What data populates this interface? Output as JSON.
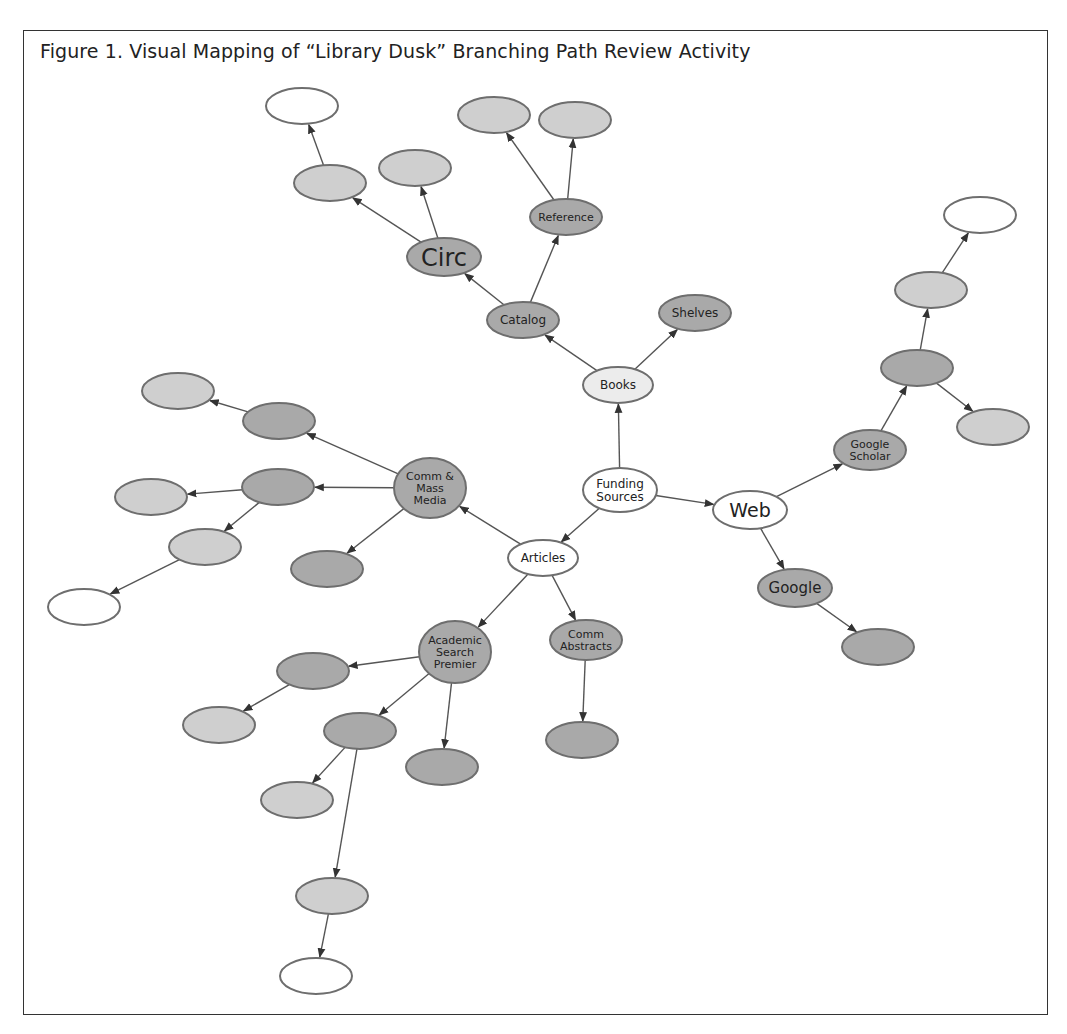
{
  "figure": {
    "title": "Figure 1. Visual Mapping of “Library Dusk” Branching Path Review Activity"
  },
  "colors": {
    "white": "#ffffff",
    "light": "#ececec",
    "medium": "#cfcfcf",
    "dark": "#a9a9a9",
    "stroke": "#6e6e6e",
    "edge": "#555555"
  },
  "nodes": [
    {
      "id": "funding",
      "label": [
        "Funding",
        "Sources"
      ],
      "x": 620,
      "y": 490,
      "rx": 37,
      "ry": 22,
      "fill": "white",
      "fs": 12
    },
    {
      "id": "books",
      "label": [
        "Books"
      ],
      "x": 618,
      "y": 385,
      "rx": 35,
      "ry": 18,
      "fill": "light",
      "fs": 12
    },
    {
      "id": "catalog",
      "label": [
        "Catalog"
      ],
      "x": 523,
      "y": 320,
      "rx": 36,
      "ry": 18,
      "fill": "dark",
      "fs": 12
    },
    {
      "id": "shelves",
      "label": [
        "Shelves"
      ],
      "x": 695,
      "y": 313,
      "rx": 36,
      "ry": 18,
      "fill": "dark",
      "fs": 12
    },
    {
      "id": "circ",
      "label": [
        "Circ"
      ],
      "x": 444,
      "y": 257,
      "rx": 37,
      "ry": 19,
      "fill": "dark",
      "fs": 24
    },
    {
      "id": "reference",
      "label": [
        "Reference"
      ],
      "x": 566,
      "y": 217,
      "rx": 36,
      "ry": 18,
      "fill": "dark",
      "fs": 11
    },
    {
      "id": "circ_a",
      "label": [],
      "x": 330,
      "y": 183,
      "rx": 36,
      "ry": 18,
      "fill": "medium"
    },
    {
      "id": "circ_a1",
      "label": [],
      "x": 302,
      "y": 106,
      "rx": 36,
      "ry": 18,
      "fill": "white"
    },
    {
      "id": "circ_b",
      "label": [],
      "x": 415,
      "y": 168,
      "rx": 36,
      "ry": 18,
      "fill": "medium"
    },
    {
      "id": "ref_a",
      "label": [],
      "x": 494,
      "y": 115,
      "rx": 36,
      "ry": 18,
      "fill": "medium"
    },
    {
      "id": "ref_b",
      "label": [],
      "x": 575,
      "y": 120,
      "rx": 36,
      "ry": 18,
      "fill": "medium"
    },
    {
      "id": "web",
      "label": [
        "Web"
      ],
      "x": 750,
      "y": 510,
      "rx": 37,
      "ry": 19,
      "fill": "white",
      "fs": 19
    },
    {
      "id": "gscholar",
      "label": [
        "Google",
        "Scholar"
      ],
      "x": 870,
      "y": 450,
      "rx": 36,
      "ry": 20,
      "fill": "dark",
      "fs": 11
    },
    {
      "id": "gs_a",
      "label": [],
      "x": 917,
      "y": 368,
      "rx": 36,
      "ry": 18,
      "fill": "dark"
    },
    {
      "id": "gs_a1",
      "label": [],
      "x": 931,
      "y": 290,
      "rx": 36,
      "ry": 18,
      "fill": "medium"
    },
    {
      "id": "gs_a2",
      "label": [],
      "x": 980,
      "y": 215,
      "rx": 36,
      "ry": 18,
      "fill": "white"
    },
    {
      "id": "gs_b",
      "label": [],
      "x": 993,
      "y": 427,
      "rx": 36,
      "ry": 18,
      "fill": "medium"
    },
    {
      "id": "google",
      "label": [
        "Google"
      ],
      "x": 795,
      "y": 588,
      "rx": 37,
      "ry": 19,
      "fill": "dark",
      "fs": 15
    },
    {
      "id": "google_a",
      "label": [],
      "x": 878,
      "y": 647,
      "rx": 36,
      "ry": 18,
      "fill": "dark"
    },
    {
      "id": "articles",
      "label": [
        "Articles"
      ],
      "x": 543,
      "y": 558,
      "rx": 35,
      "ry": 18,
      "fill": "white",
      "fs": 12
    },
    {
      "id": "cmm",
      "label": [
        "Comm &",
        "Mass",
        "Media"
      ],
      "x": 430,
      "y": 488,
      "rx": 36,
      "ry": 30,
      "fill": "dark",
      "fs": 11
    },
    {
      "id": "cmm_a",
      "label": [],
      "x": 279,
      "y": 421,
      "rx": 36,
      "ry": 18,
      "fill": "dark"
    },
    {
      "id": "cmm_a1",
      "label": [],
      "x": 178,
      "y": 391,
      "rx": 36,
      "ry": 18,
      "fill": "medium"
    },
    {
      "id": "cmm_b",
      "label": [],
      "x": 278,
      "y": 487,
      "rx": 36,
      "ry": 18,
      "fill": "dark"
    },
    {
      "id": "cmm_b1",
      "label": [],
      "x": 151,
      "y": 497,
      "rx": 36,
      "ry": 18,
      "fill": "medium"
    },
    {
      "id": "cmm_b2",
      "label": [],
      "x": 205,
      "y": 547,
      "rx": 36,
      "ry": 18,
      "fill": "medium"
    },
    {
      "id": "cmm_b3",
      "label": [],
      "x": 84,
      "y": 607,
      "rx": 36,
      "ry": 18,
      "fill": "white"
    },
    {
      "id": "cmm_c",
      "label": [],
      "x": 327,
      "y": 569,
      "rx": 36,
      "ry": 18,
      "fill": "dark"
    },
    {
      "id": "cabs",
      "label": [
        "Comm",
        "Abstracts"
      ],
      "x": 586,
      "y": 640,
      "rx": 36,
      "ry": 20,
      "fill": "dark",
      "fs": 11
    },
    {
      "id": "cabs_a",
      "label": [],
      "x": 582,
      "y": 740,
      "rx": 36,
      "ry": 18,
      "fill": "dark"
    },
    {
      "id": "asp",
      "label": [
        "Academic",
        "Search",
        "Premier"
      ],
      "x": 455,
      "y": 652,
      "rx": 36,
      "ry": 31,
      "fill": "dark",
      "fs": 11
    },
    {
      "id": "asp_a",
      "label": [],
      "x": 313,
      "y": 671,
      "rx": 36,
      "ry": 18,
      "fill": "dark"
    },
    {
      "id": "asp_a1",
      "label": [],
      "x": 219,
      "y": 725,
      "rx": 36,
      "ry": 18,
      "fill": "medium"
    },
    {
      "id": "asp_b",
      "label": [],
      "x": 360,
      "y": 731,
      "rx": 36,
      "ry": 18,
      "fill": "dark"
    },
    {
      "id": "asp_b1",
      "label": [],
      "x": 297,
      "y": 800,
      "rx": 36,
      "ry": 18,
      "fill": "medium"
    },
    {
      "id": "asp_b2",
      "label": [],
      "x": 332,
      "y": 896,
      "rx": 36,
      "ry": 18,
      "fill": "medium"
    },
    {
      "id": "asp_b3",
      "label": [],
      "x": 316,
      "y": 976,
      "rx": 36,
      "ry": 18,
      "fill": "white"
    },
    {
      "id": "asp_c",
      "label": [],
      "x": 442,
      "y": 767,
      "rx": 36,
      "ry": 18,
      "fill": "dark"
    }
  ],
  "edges": [
    {
      "from": "funding",
      "to": "books"
    },
    {
      "from": "funding",
      "to": "web"
    },
    {
      "from": "funding",
      "to": "articles"
    },
    {
      "from": "books",
      "to": "catalog"
    },
    {
      "from": "books",
      "to": "shelves"
    },
    {
      "from": "catalog",
      "to": "circ"
    },
    {
      "from": "catalog",
      "to": "reference"
    },
    {
      "from": "circ",
      "to": "circ_a"
    },
    {
      "from": "circ",
      "to": "circ_b"
    },
    {
      "from": "circ_a",
      "to": "circ_a1"
    },
    {
      "from": "reference",
      "to": "ref_a"
    },
    {
      "from": "reference",
      "to": "ref_b"
    },
    {
      "from": "web",
      "to": "gscholar"
    },
    {
      "from": "web",
      "to": "google"
    },
    {
      "from": "gscholar",
      "to": "gs_a"
    },
    {
      "from": "gs_a",
      "to": "gs_a1"
    },
    {
      "from": "gs_a1",
      "to": "gs_a2"
    },
    {
      "from": "gs_a",
      "to": "gs_b"
    },
    {
      "from": "google",
      "to": "google_a"
    },
    {
      "from": "articles",
      "to": "cmm"
    },
    {
      "from": "articles",
      "to": "asp"
    },
    {
      "from": "articles",
      "to": "cabs"
    },
    {
      "from": "cmm",
      "to": "cmm_a"
    },
    {
      "from": "cmm_a",
      "to": "cmm_a1"
    },
    {
      "from": "cmm",
      "to": "cmm_b"
    },
    {
      "from": "cmm_b",
      "to": "cmm_b1"
    },
    {
      "from": "cmm_b",
      "to": "cmm_b2"
    },
    {
      "from": "cmm_b2",
      "to": "cmm_b3"
    },
    {
      "from": "cmm",
      "to": "cmm_c"
    },
    {
      "from": "cabs",
      "to": "cabs_a"
    },
    {
      "from": "asp",
      "to": "asp_a"
    },
    {
      "from": "asp_a",
      "to": "asp_a1"
    },
    {
      "from": "asp",
      "to": "asp_b"
    },
    {
      "from": "asp_b",
      "to": "asp_b1"
    },
    {
      "from": "asp_b",
      "to": "asp_b2"
    },
    {
      "from": "asp_b2",
      "to": "asp_b3"
    },
    {
      "from": "asp",
      "to": "asp_c"
    }
  ]
}
